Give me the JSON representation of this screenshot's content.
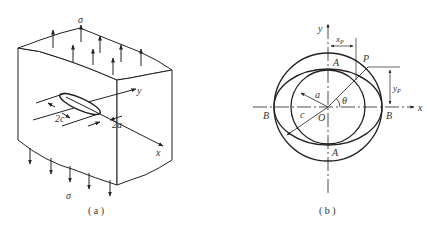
{
  "figure_a": {
    "caption": "( a )",
    "stress_top": "σ",
    "stress_bottom": "σ",
    "dim_major": "2c",
    "dim_minor": "2a",
    "axis_x": "x",
    "axis_y": "y"
  },
  "figure_b": {
    "caption": "( b )",
    "axis_x": "x",
    "axis_y": "y",
    "origin": "O",
    "point_p": "P",
    "point_a_top": "A",
    "point_a_bottom": "A",
    "point_b_left": "B",
    "point_b_right": "B",
    "radius_a": "a",
    "radius_c": "c",
    "angle": "θ",
    "dim_xp": "x",
    "dim_xp_sub": "P",
    "dim_yp": "y",
    "dim_yp_sub": "P"
  },
  "colors": {
    "line": "#222222",
    "text": "#333333"
  }
}
